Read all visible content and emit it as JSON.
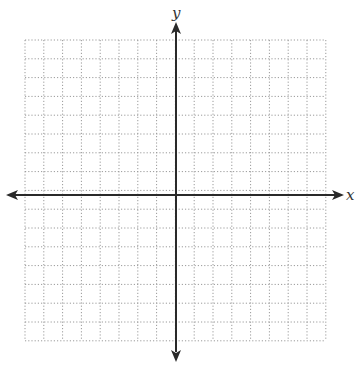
{
  "diagram": {
    "type": "coordinate-plane",
    "x_axis_label": "x",
    "y_axis_label": "y",
    "grid": {
      "columns": 16,
      "rows": 16,
      "cell_size_px": 18.8,
      "left": 25,
      "top": 40,
      "origin_px": [
        176,
        195
      ],
      "line_style": "dotted",
      "line_color": "#9a9a9a"
    },
    "axis_color": "#2a2a2a",
    "arrows": [
      "left",
      "right",
      "up",
      "down"
    ]
  }
}
